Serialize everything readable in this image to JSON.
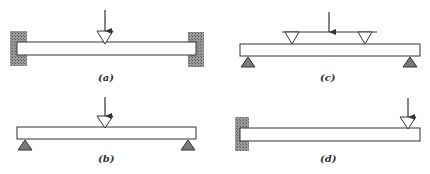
{
  "figure": {
    "panels": [
      {
        "id": "a",
        "label": "(a)",
        "type": "fixed-fixed beam",
        "load": "single concentrated load at midspan"
      },
      {
        "id": "b",
        "label": "(b)",
        "type": "simply supported beam",
        "load": "single concentrated load at midspan"
      },
      {
        "id": "c",
        "label": "(c)",
        "type": "simply supported beam",
        "load": "two-point load via spreader bar"
      },
      {
        "id": "d",
        "label": "(d)",
        "type": "cantilever beam",
        "load": "concentrated load at free end"
      }
    ]
  },
  "colors": {
    "stroke": "#333333",
    "wall_fill": "#8a8a8a",
    "support_fill": "#7a7a7a",
    "background": "#ffffff"
  }
}
